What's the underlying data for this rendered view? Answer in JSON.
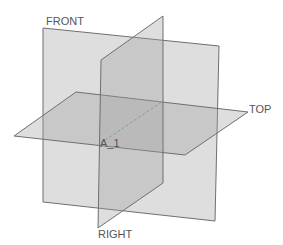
{
  "scene": {
    "background": "#ffffff",
    "plane_fill": "#a0a0a0",
    "plane_fill_opacity": 0.35,
    "edge_color": "#6f6f6f",
    "label_color": "#555555"
  },
  "planes": [
    {
      "id": "front",
      "label": "FRONT",
      "points": "43,28 219,46 215,221 43,202",
      "label_pos": [
        46,
        25
      ]
    },
    {
      "id": "top",
      "label": "TOP",
      "points": "76,92 248,112 185,155 14,136",
      "label_pos": [
        249,
        113
      ]
    },
    {
      "id": "right",
      "label": "RIGHT",
      "points": "101,60 163,16 163,183 98,228",
      "label_pos": [
        98,
        238
      ]
    }
  ],
  "axis": {
    "label": "A_1",
    "x1": 101,
    "y1": 143,
    "x2": 163,
    "y2": 101,
    "label_pos": [
      100,
      147
    ]
  }
}
